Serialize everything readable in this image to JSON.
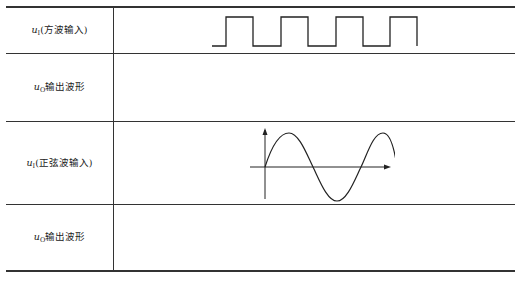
{
  "table": {
    "rows": [
      {
        "var": "u",
        "sub": "I",
        "label": "(方波输入)",
        "content": "square-wave"
      },
      {
        "var": "u",
        "sub": "O",
        "label": "输出波形",
        "content": ""
      },
      {
        "var": "u",
        "sub": "I",
        "label": "(正弦波输入)",
        "content": "sine-wave"
      },
      {
        "var": "u",
        "sub": "O",
        "label": "输出波形",
        "content": ""
      }
    ]
  },
  "colors": {
    "line": "#333333",
    "text": "#222222"
  }
}
